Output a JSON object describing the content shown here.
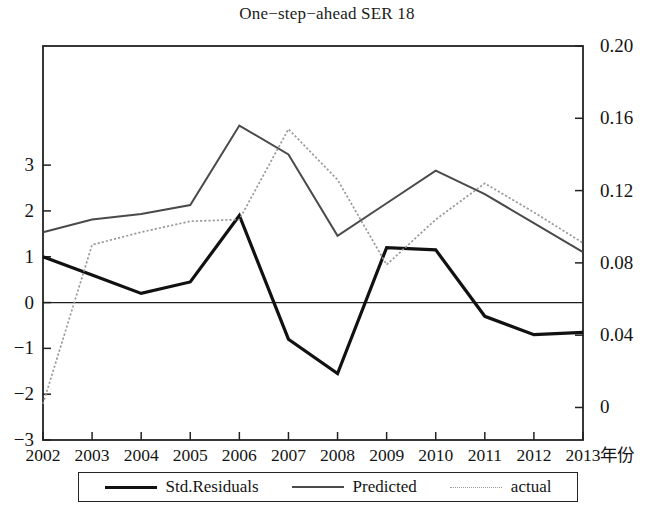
{
  "chart_data": {
    "type": "line",
    "title": "One−step−ahead SER 18",
    "xlabel": "年份",
    "ylabel_left": "",
    "ylabel_right": "",
    "categories": [
      "2002",
      "2003",
      "2004",
      "2005",
      "2006",
      "2007",
      "2008",
      "2009",
      "2010",
      "2011",
      "2012",
      "2013"
    ],
    "x": [
      2002,
      2003,
      2004,
      2005,
      2006,
      2007,
      2008,
      2009,
      2010,
      2011,
      2012,
      2013
    ],
    "left_axis": {
      "ticks": [
        3,
        2,
        1,
        0,
        -1,
        -2,
        -3
      ],
      "tick_labels": [
        "3",
        "2",
        "1",
        "0",
        "−1",
        "−2",
        "−3"
      ],
      "ylim": [
        -3,
        5.6
      ]
    },
    "right_axis": {
      "ticks": [
        0.2,
        0.16,
        0.12,
        0.08,
        0.04,
        0
      ],
      "tick_labels": [
        "0.20",
        "0.16",
        "0.12",
        "0.08",
        "0.04",
        "0"
      ],
      "ylim": [
        -0.018,
        0.2
      ]
    },
    "grid": false,
    "zero_line": true,
    "legend_position": "bottom",
    "series": [
      {
        "name": "Std.Residuals",
        "axis": "left",
        "style": "solid-thick",
        "color": "#111111",
        "values": [
          1.0,
          0.6,
          0.2,
          0.45,
          1.9,
          -0.8,
          -1.55,
          1.2,
          1.15,
          -0.3,
          -0.7,
          -0.65
        ]
      },
      {
        "name": "Predicted",
        "axis": "right",
        "style": "solid-medium",
        "color": "#4a4a4a",
        "values": [
          0.097,
          0.104,
          0.107,
          0.112,
          0.156,
          0.14,
          0.095,
          0.113,
          0.131,
          0.118,
          0.102,
          0.086
        ]
      },
      {
        "name": "actual",
        "axis": "right",
        "style": "dotted-light",
        "color": "#9a9a9a",
        "values": [
          0.002,
          0.09,
          0.097,
          0.103,
          0.104,
          0.154,
          0.126,
          0.079,
          0.104,
          0.124,
          0.108,
          0.091
        ]
      }
    ]
  },
  "legend": {
    "items": [
      {
        "label": "Std.Residuals",
        "swatch": "solid-thick-line-icon"
      },
      {
        "label": "Predicted",
        "swatch": "solid-medium-line-icon"
      },
      {
        "label": "actual",
        "swatch": "dotted-light-line-icon"
      }
    ]
  }
}
